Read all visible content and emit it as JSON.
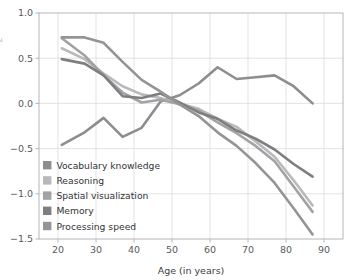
{
  "chart_data": {
    "type": "line",
    "title": "",
    "xlabel": "Age (in years)",
    "ylabel": "",
    "xlim": [
      15,
      95
    ],
    "ylim": [
      -1.5,
      1.0
    ],
    "xticks": [
      20,
      30,
      40,
      50,
      60,
      70,
      80,
      90
    ],
    "yticks": [
      -1.5,
      -1.0,
      -0.5,
      0.0,
      0.5,
      1.0
    ],
    "xtick_labels": [
      "20",
      "30",
      "40",
      "50",
      "60",
      "70",
      "80",
      "90"
    ],
    "ytick_labels": [
      "-1.5",
      "-1.0",
      "-0.5",
      "0.0",
      "0.5",
      "1.0"
    ],
    "grid": true,
    "legend_position": "lower-left-inside",
    "x": [
      21,
      27,
      32,
      37,
      42,
      47,
      52,
      57,
      62,
      67,
      72,
      77,
      82,
      87
    ],
    "series": [
      {
        "name": "Vocabulary knowledge",
        "color": "#8d8d8f",
        "values": [
          -0.46,
          -0.32,
          -0.16,
          -0.37,
          -0.27,
          0.02,
          0.09,
          0.22,
          0.4,
          0.27,
          0.29,
          0.31,
          0.19,
          0.0
        ]
      },
      {
        "name": "Reasoning",
        "color": "#b9b9bb",
        "values": [
          0.61,
          0.49,
          0.33,
          0.19,
          0.1,
          0.06,
          0.0,
          -0.06,
          -0.17,
          -0.26,
          -0.42,
          -0.59,
          -0.85,
          -1.13
        ]
      },
      {
        "name": "Spatial visualization",
        "color": "#a2a2a4",
        "values": [
          0.72,
          0.53,
          0.31,
          0.12,
          0.01,
          0.04,
          -0.01,
          -0.08,
          -0.21,
          -0.33,
          -0.47,
          -0.64,
          -0.92,
          -1.2
        ]
      },
      {
        "name": "Memory",
        "color": "#7e7e80",
        "values": [
          0.49,
          0.44,
          0.31,
          0.08,
          0.06,
          0.11,
          0.01,
          -0.1,
          -0.17,
          -0.3,
          -0.39,
          -0.51,
          -0.67,
          -0.81
        ]
      },
      {
        "name": "Processing speed",
        "color": "#949496",
        "values": [
          0.73,
          0.73,
          0.67,
          0.46,
          0.26,
          0.13,
          -0.01,
          -0.14,
          -0.32,
          -0.47,
          -0.66,
          -0.88,
          -1.16,
          -1.45
        ]
      }
    ]
  },
  "axes": {
    "frame_color": "#b5b5b7",
    "grid_color": "#dcdcde",
    "background": "#ffffff"
  },
  "partial_ylabel": {
    "text": "z",
    "note_visible_fragment": "cropped"
  }
}
